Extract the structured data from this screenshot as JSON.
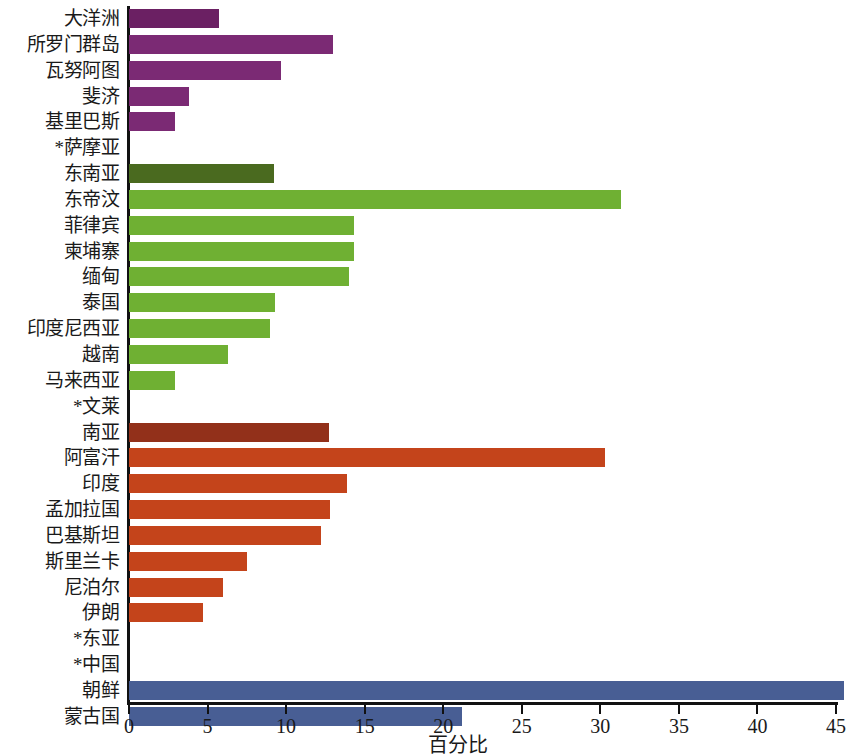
{
  "chart_data": {
    "type": "bar",
    "orientation": "horizontal",
    "title": "",
    "xlabel": "百分比",
    "ylabel": "",
    "xlim": [
      0,
      45
    ],
    "xticks": [
      0,
      5,
      10,
      15,
      20,
      25,
      30,
      35,
      40,
      45
    ],
    "grid": false,
    "legend": "none",
    "categories": [
      "大洋洲",
      "所罗门群岛",
      "瓦努阿图",
      "斐济",
      "基里巴斯",
      "*萨摩亚",
      "东南亚",
      "东帝汶",
      "菲律宾",
      "柬埔寨",
      "缅甸",
      "泰国",
      "印度尼西亚",
      "越南",
      "马来西亚",
      "*文莱",
      "南亚",
      "阿富汗",
      "印度",
      "孟加拉国",
      "巴基斯坦",
      "斯里兰卡",
      "尼泊尔",
      "伊朗",
      "*东亚",
      "*中国",
      "朝鲜",
      "蒙古国"
    ],
    "values": [
      5.7,
      13.0,
      9.7,
      3.8,
      2.9,
      0,
      9.2,
      31.3,
      14.3,
      14.3,
      14.0,
      9.3,
      9.0,
      6.3,
      2.9,
      0,
      12.7,
      30.3,
      13.9,
      12.8,
      12.2,
      7.5,
      6.0,
      4.7,
      0,
      0,
      45.5,
      21.2
    ],
    "colors": [
      "#6b2063",
      "#7b2a74",
      "#7b2a74",
      "#7b2a74",
      "#7b2a74",
      "#7b2a74",
      "#4a6a1f",
      "#6fb033",
      "#6fb033",
      "#6fb033",
      "#6fb033",
      "#6fb033",
      "#6fb033",
      "#6fb033",
      "#6fb033",
      "#6fb033",
      "#92301a",
      "#c4441b",
      "#c4441b",
      "#c4441b",
      "#c4441b",
      "#c4441b",
      "#c4441b",
      "#c4441b",
      "#c4441b",
      "#485e94",
      "#485e94",
      "#485e94"
    ],
    "group_colors": {
      "oceania": "#7b2a74",
      "oceania_region": "#6b2063",
      "southeast_asia": "#6fb033",
      "southeast_asia_region": "#4a6a1f",
      "south_asia": "#c4441b",
      "south_asia_region": "#92301a",
      "east_asia": "#485e94"
    },
    "axis_color": "#111111",
    "background": "#ffffff",
    "note": "* 表示无数据（条形长度为 0）"
  }
}
